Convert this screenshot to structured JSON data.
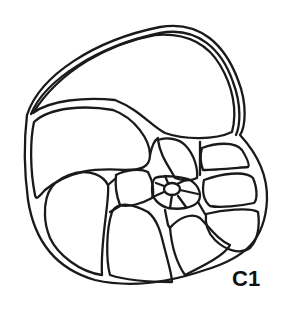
{
  "figure": {
    "label": "C1",
    "line_color": "#1a1a1a",
    "background": "#ffffff"
  }
}
